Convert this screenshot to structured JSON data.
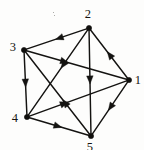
{
  "figure": {
    "kind": "directed-graph",
    "background_color": "#fdfdfc",
    "ink_color": "#141311",
    "width": 144,
    "height": 150
  },
  "nodes": [
    {
      "id": "1",
      "label": "1",
      "x": 129,
      "y": 80,
      "label_x": 138,
      "label_y": 80
    },
    {
      "id": "2",
      "label": "2",
      "x": 89,
      "y": 28,
      "label_x": 88,
      "label_y": 14
    },
    {
      "id": "3",
      "label": "3",
      "x": 24,
      "y": 50,
      "label_x": 13,
      "label_y": 47
    },
    {
      "id": "4",
      "label": "4",
      "x": 27,
      "y": 117,
      "label_x": 15,
      "label_y": 118
    },
    {
      "id": "5",
      "label": "5",
      "x": 91,
      "y": 136,
      "label_x": 90,
      "label_y": 147
    }
  ],
  "edges": [
    {
      "from": "2",
      "to": "3",
      "arrow_t": 0.52
    },
    {
      "from": "1",
      "to": "2",
      "arrow_t": 0.55
    },
    {
      "from": "3",
      "to": "4",
      "arrow_t": 0.56
    },
    {
      "from": "4",
      "to": "5",
      "arrow_t": 0.55
    },
    {
      "from": "1",
      "to": "5",
      "arrow_t": 0.55
    },
    {
      "from": "2",
      "to": "5",
      "arrow_t": 0.52
    },
    {
      "from": "3",
      "to": "1",
      "arrow_t": 0.42
    },
    {
      "from": "2",
      "to": "4",
      "arrow_t": 0.45
    },
    {
      "from": "5",
      "to": "3",
      "arrow_t": 0.42
    },
    {
      "from": "4",
      "to": "1",
      "arrow_t": 0.4
    }
  ],
  "specks": [
    {
      "x": 53,
      "y": 12,
      "size": 1.3
    },
    {
      "x": 54,
      "y": 15,
      "size": 1.0
    }
  ]
}
